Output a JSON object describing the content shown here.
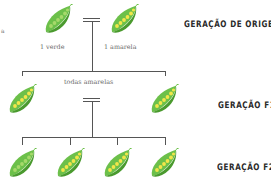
{
  "diagram": {
    "colors": {
      "pod_green": "#6cc04a",
      "pod_dark": "#4a9a2e",
      "pea_green": "#a6d96a",
      "pea_yellow": "#f2e64a",
      "line": "#555555",
      "label": "#2a2a2a",
      "caption": "#6a6a6a"
    },
    "edge_mark": "a",
    "generations": [
      {
        "label": "GERAÇÃO DE ORIGEM",
        "pods": [
          {
            "pea_color": "green",
            "caption": "1 verde"
          },
          {
            "pea_color": "yellow",
            "caption": "1 amarela"
          }
        ],
        "cross_symbol": "="
      },
      {
        "label": "GERAÇÃO F1",
        "caption": "todas amarelas",
        "pods": [
          {
            "pea_color": "yellow"
          },
          {
            "pea_color": "yellow"
          }
        ],
        "cross_symbol": "="
      },
      {
        "label": "GERAÇÃO F2",
        "pods": [
          {
            "pea_color": "green"
          },
          {
            "pea_color": "yellow"
          },
          {
            "pea_color": "yellow"
          },
          {
            "pea_color": "yellow"
          }
        ]
      }
    ]
  }
}
